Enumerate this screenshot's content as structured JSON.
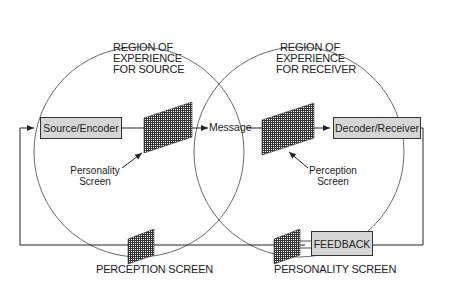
{
  "diagram": {
    "regions": {
      "source": {
        "line1": "REGION OF",
        "line2": "EXPERIENCE",
        "line3": "FOR SOURCE"
      },
      "receiver": {
        "line1": "REGION OF",
        "line2": "EXPERIENCE",
        "line3": "FOR RECEIVER"
      }
    },
    "boxes": {
      "source_encoder": "Source/Encoder",
      "decoder_receiver": "Decoder/Receiver",
      "feedback": "FEEDBACK"
    },
    "labels": {
      "message": "Message",
      "personality_screen_inner": {
        "line1": "Personality",
        "line2": "Screen"
      },
      "perception_screen_inner": {
        "line1": "Perception",
        "line2": "Screen"
      },
      "perception_screen_bottom": "PERCEPTION SCREEN",
      "personality_screen_bottom": "PERSONALITY SCREEN"
    },
    "colors": {
      "box_fill": "#d6d6d6",
      "line": "#222222",
      "screen_fill": "#555555"
    }
  }
}
